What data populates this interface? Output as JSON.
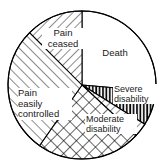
{
  "chart_data": {
    "type": "pie",
    "title": "",
    "subtitle": "",
    "xlabel": "",
    "ylabel": "",
    "legend_position": "none",
    "grid": false,
    "labels_on_slices": true,
    "outline_color": "#000000",
    "background_color": "#ffffff",
    "center": {
      "x": 82,
      "y": 85
    },
    "radius": 74,
    "start_angle_deg": 0,
    "direction": "clockwise",
    "categories": [
      "Death",
      "Severe disability",
      "Moderate disability",
      "Pain easily controlled",
      "Pain ceased"
    ],
    "values": [
      26.4,
      7.5,
      26.4,
      27.8,
      11.9
    ],
    "slices": [
      {
        "label": "Death",
        "value": 26.4,
        "start_deg": 0,
        "end_deg": 95,
        "fill": "none",
        "pattern": "blank"
      },
      {
        "label": "Severe disability",
        "value": 7.5,
        "start_deg": 95,
        "end_deg": 122,
        "fill": "#ffffff",
        "pattern": "vertical-lines"
      },
      {
        "label": "",
        "value": 3.1,
        "start_deg": 122,
        "end_deg": 133,
        "fill": "#ffffff",
        "pattern": "diagonal-down"
      },
      {
        "label": "Moderate disability",
        "value": 22.8,
        "start_deg": 133,
        "end_deg": 215,
        "fill": "#ffffff",
        "pattern": "cross-hatch"
      },
      {
        "label": "Pain easily controlled",
        "value": 27.8,
        "start_deg": 215,
        "end_deg": 315,
        "fill": "#ffffff",
        "pattern": "diagonal-up"
      },
      {
        "label": "Pain ceased",
        "value": 12.5,
        "start_deg": 315,
        "end_deg": 360,
        "fill": "#ffffff",
        "pattern": "diagonal-down"
      }
    ]
  },
  "labels": {
    "death": "Death",
    "pain_ceased": "Pain\nceased",
    "pain_controlled": "Pain\neasily\ncontrolled",
    "severe_disability": "Severe\ndisability",
    "moderate_disability": "Moderate\ndisability"
  }
}
